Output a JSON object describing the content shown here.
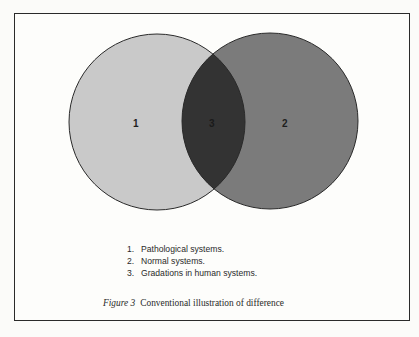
{
  "figure": {
    "caption_prefix": "Figure 3",
    "caption_text": "Conventional illustration of difference"
  },
  "venn": {
    "circles": [
      {
        "id": "1",
        "label": "1",
        "cx": 157,
        "cy": 122,
        "r": 88,
        "fill": "#c9c9c9"
      },
      {
        "id": "2",
        "label": "2",
        "cx": 270,
        "cy": 121,
        "r": 88,
        "fill": "#7b7b7b"
      }
    ],
    "intersection": {
      "label": "3",
      "fill": "#333333"
    },
    "stroke": "#2a2a2a"
  },
  "legend": {
    "items": [
      {
        "num": "1.",
        "text": "Pathological systems."
      },
      {
        "num": "2.",
        "text": "Normal systems."
      },
      {
        "num": "3.",
        "text": "Gradations in human systems."
      }
    ]
  }
}
